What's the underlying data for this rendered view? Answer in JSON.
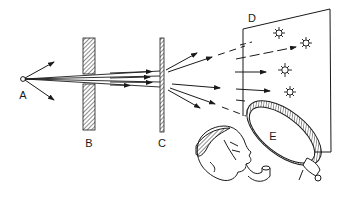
{
  "diagram": {
    "labels": {
      "source": "A",
      "barrier": "B",
      "foil": "C",
      "screen": "D",
      "magnifier": "E"
    },
    "colors": {
      "ink": "#1a1a1a",
      "background": "#ffffff"
    },
    "elements": [
      {
        "id": "A",
        "kind": "point-source"
      },
      {
        "id": "B",
        "kind": "thick-hatched-barrier-with-slit"
      },
      {
        "id": "C",
        "kind": "thin-hatched-foil"
      },
      {
        "id": "D",
        "kind": "screen-with-scintillation-flashes",
        "flash_count": 4
      },
      {
        "id": "E",
        "kind": "magnifying-lens-held-by-observer"
      }
    ]
  }
}
